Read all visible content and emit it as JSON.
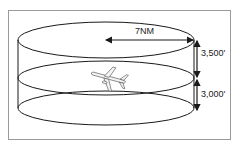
{
  "diagram": {
    "radius_label": "7NM",
    "upper_height_label": "3,500'",
    "lower_height_label": "3,000'",
    "icons": [
      "airplane-icon"
    ],
    "colors": {
      "line": "#1a1a1a",
      "frame": "#9a9a9a",
      "background": "#ffffff"
    }
  }
}
